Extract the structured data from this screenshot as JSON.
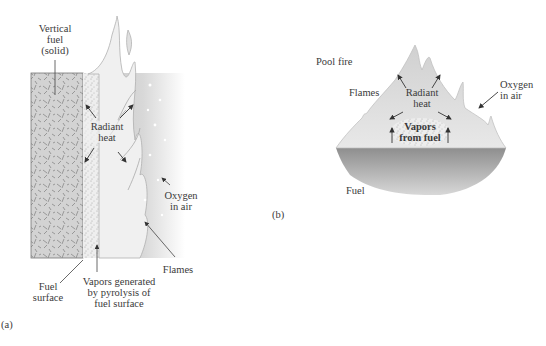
{
  "figure_a": {
    "panel_label": "(a)",
    "labels": {
      "vertical_fuel": [
        "Vertical",
        "fuel",
        "(solid)"
      ],
      "radiant_heat": [
        "Radiant",
        "heat"
      ],
      "oxygen_in_air": [
        "Oxygen",
        "in air"
      ],
      "flames": "Flames",
      "fuel_surface": [
        "Fuel",
        "surface"
      ],
      "vapors_generated": [
        "Vapors generated",
        "by pyrolysis of",
        "fuel surface"
      ]
    }
  },
  "figure_b": {
    "panel_label": "(b)",
    "labels": {
      "pool_fire": "Pool fire",
      "flames": "Flames",
      "radiant_heat": [
        "Radiant",
        "heat"
      ],
      "oxygen_in_air": [
        "Oxygen",
        "in air"
      ],
      "vapors_from_fuel": [
        "Vapors",
        "from fuel"
      ],
      "fuel": "Fuel"
    }
  },
  "colors": {
    "flame_fill": "#dcdcdc",
    "flame_edge": "#a8a8a8",
    "fuel_block": "#cfcfcf",
    "air_gradient": "#b8b8b8",
    "pool_fuel": "#9a9a9a"
  }
}
